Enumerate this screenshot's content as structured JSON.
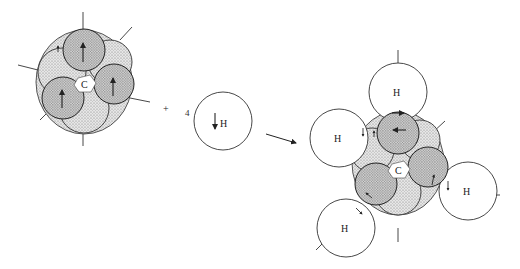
{
  "figure": {
    "type": "reaction-schematic",
    "reactant_carbon": {
      "label": "C",
      "orbital_lobes": 4,
      "spin_arrows": "up"
    },
    "operator": "+",
    "reactant_hydrogen": {
      "coefficient": "4",
      "label": "H",
      "spin_arrow": "down"
    },
    "reaction_arrow": "→",
    "product": {
      "center_label": "C",
      "hydrogens": [
        {
          "label": "H",
          "position": "top"
        },
        {
          "label": "H",
          "position": "upper-left"
        },
        {
          "label": "H",
          "position": "right"
        },
        {
          "label": "H",
          "position": "lower-left"
        }
      ]
    }
  },
  "colors": {
    "ink": "#333333",
    "stipple": "#9a9a9a",
    "background": "#ffffff"
  }
}
